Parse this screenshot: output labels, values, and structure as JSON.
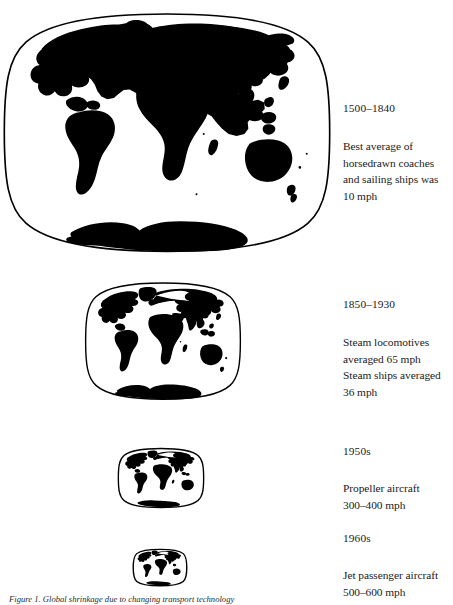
{
  "figure": {
    "caption": "Figure 1. Global shrinkage due to changing transport technology",
    "ink_color": "#000000",
    "background_color": "#ffffff"
  },
  "panels": [
    {
      "id": "panel-1",
      "era": "1500–1840",
      "description": "Best average of\nhorsedrawn coaches\nand sailing ships was\n10 mph",
      "map_name": "world-map-large"
    },
    {
      "id": "panel-2",
      "era": "1850–1930",
      "description": "Steam locomotives\naveraged 65 mph\nSteam ships averaged\n36 mph",
      "map_name": "world-map-medium"
    },
    {
      "id": "panel-3",
      "era": "1950s",
      "description": "Propeller aircraft\n300–400 mph",
      "map_name": "world-map-small"
    },
    {
      "id": "panel-4",
      "era": "1960s",
      "description": "Jet passenger aircraft\n500–600 mph",
      "map_name": "world-map-tiny"
    }
  ]
}
